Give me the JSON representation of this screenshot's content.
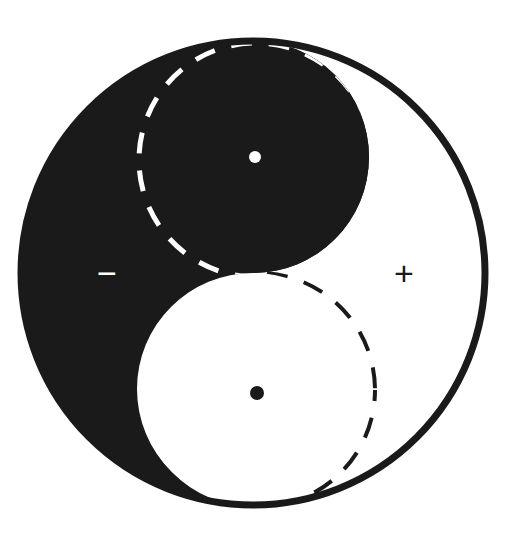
{
  "figure": {
    "background_color": "#ffffff",
    "width": 507,
    "height": 537
  },
  "palette": {
    "ink": "#1a1a1a",
    "paper": "#ffffff",
    "stroke": "#1a1a1a"
  },
  "annotations": {
    "minus_sign": "−",
    "plus_sign": "+",
    "minus_region": "yin",
    "plus_region": "yang"
  },
  "chart_data": {
    "type": "diagram",
    "shapes": [
      {
        "name": "outer-circle",
        "kind": "circle",
        "cx": 253,
        "cy": 273,
        "r": 232,
        "fill": "none",
        "stroke": "#1a1a1a",
        "stroke_width": 7
      },
      {
        "name": "yin-half",
        "kind": "taiji-half",
        "fill": "#1a1a1a",
        "side": "left"
      },
      {
        "name": "yin-lobe",
        "kind": "circle",
        "cx": 253,
        "cy": 157,
        "r": 116,
        "fill": "#1a1a1a"
      },
      {
        "name": "yang-lobe",
        "kind": "circle",
        "cx": 255,
        "cy": 391,
        "r": 116,
        "fill": "#ffffff"
      },
      {
        "name": "yin-eye",
        "kind": "circle",
        "cx": 255,
        "cy": 157,
        "r": 6,
        "fill": "#ffffff"
      },
      {
        "name": "yang-eye",
        "kind": "circle",
        "cx": 257,
        "cy": 393,
        "r": 7,
        "fill": "#1a1a1a"
      },
      {
        "name": "upper-dashed-construction-circle",
        "kind": "circle",
        "cx": 256,
        "cy": 160,
        "r": 117,
        "fill": "none",
        "stroke": "#ffffff",
        "stroke_width": 5,
        "dash": "20 16"
      },
      {
        "name": "lower-dashed-construction-circle",
        "kind": "circle",
        "cx": 258,
        "cy": 390,
        "r": 117,
        "fill": "none",
        "stroke": "#1a1a1a",
        "stroke_width": 4,
        "dash": "20 16"
      }
    ],
    "labels": [
      {
        "name": "minus-sign",
        "text": "−",
        "x": 105,
        "y": 274,
        "color": "#ffffff"
      },
      {
        "name": "plus-sign",
        "text": "+",
        "x": 403,
        "y": 274,
        "color": "#1a1a1a"
      }
    ]
  }
}
